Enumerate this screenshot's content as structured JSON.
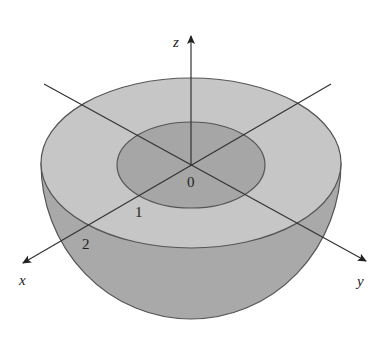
{
  "figure": {
    "axes": {
      "x_label": "x",
      "y_label": "y",
      "z_label": "z"
    },
    "tick_labels": {
      "origin": "0",
      "one": "1",
      "two": "2"
    },
    "colors": {
      "outer_rim_fill": "#c4c4c4",
      "inner_disk_fill": "#a8a8a8",
      "bowl_fill": "#a9a9a9",
      "outline": "#555555",
      "axis": "#333333"
    },
    "geometry": {
      "inner_radius": 1,
      "outer_radius": 2
    }
  }
}
